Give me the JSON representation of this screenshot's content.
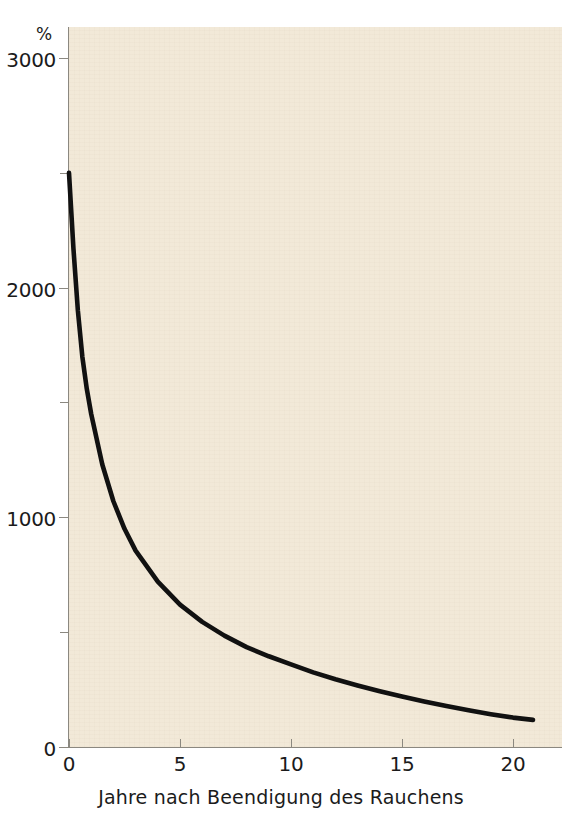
{
  "figure": {
    "background_color": "#ffffff",
    "plot_background_color": "#f2e9d8",
    "axis_color": "#8b8880",
    "curve_color": "#111111"
  },
  "axes": {
    "y_unit_label": "%",
    "y_major_labels": [
      "0",
      "1000",
      "2000",
      "3000"
    ],
    "x_tick_labels": [
      "0",
      "5",
      "10",
      "15",
      "20"
    ],
    "x_title": "Jahre nach Beendigung des Rauchens"
  },
  "chart_data": {
    "type": "line",
    "title": "",
    "subtitle": "",
    "xlabel": "Jahre nach Beendigung des Rauchens",
    "ylabel": "%",
    "xlim": [
      0,
      22
    ],
    "ylim": [
      0,
      3000
    ],
    "x_ticks": [
      0,
      5,
      10,
      15,
      20
    ],
    "y_ticks": [
      0,
      1000,
      2000,
      3000
    ],
    "y_minor_ticks": [
      500,
      1500,
      2500
    ],
    "grid": false,
    "legend": null,
    "series": [
      {
        "name": "Relatives Risiko",
        "x": [
          0.0,
          0.2,
          0.4,
          0.6,
          0.8,
          1.0,
          1.5,
          2.0,
          2.5,
          3.0,
          4.0,
          5.0,
          6.0,
          7.0,
          8.0,
          9.0,
          10.0,
          11.0,
          12.0,
          13.0,
          14.0,
          15.0,
          16.0,
          17.0,
          18.0,
          19.0,
          20.0,
          20.9
        ],
        "y": [
          2500,
          2170,
          1900,
          1700,
          1560,
          1450,
          1230,
          1070,
          950,
          855,
          720,
          620,
          545,
          485,
          435,
          395,
          360,
          325,
          295,
          268,
          243,
          220,
          198,
          178,
          160,
          143,
          128,
          118
        ]
      }
    ]
  }
}
